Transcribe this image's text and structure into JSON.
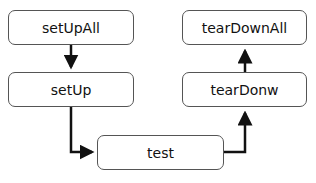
{
  "diagram": {
    "type": "flowchart",
    "nodes": [
      {
        "id": "setUpAll",
        "label": "setUpAll"
      },
      {
        "id": "setUp",
        "label": "setUp"
      },
      {
        "id": "test",
        "label": "test"
      },
      {
        "id": "tearDonw",
        "label": "tearDonw"
      },
      {
        "id": "tearDownAll",
        "label": "tearDownAll"
      }
    ],
    "edges": [
      {
        "from": "setUpAll",
        "to": "setUp"
      },
      {
        "from": "setUp",
        "to": "test"
      },
      {
        "from": "test",
        "to": "tearDonw"
      },
      {
        "from": "tearDonw",
        "to": "tearDownAll"
      }
    ]
  }
}
